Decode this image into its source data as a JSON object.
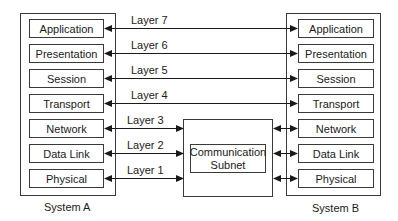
{
  "diagram": {
    "type": "OSI reference model communication diagram",
    "system_a": {
      "label": "System A",
      "layers": [
        "Application",
        "Presentation",
        "Session",
        "Transport",
        "Network",
        "Data Link",
        "Physical"
      ]
    },
    "system_b": {
      "label": "System B",
      "layers": [
        "Application",
        "Presentation",
        "Session",
        "Transport",
        "Network",
        "Data Link",
        "Physical"
      ]
    },
    "subnet": {
      "line1": "Communication",
      "line2": "Subnet"
    },
    "layer_labels": [
      "Layer 7",
      "Layer 6",
      "Layer 5",
      "Layer 4",
      "Layer 3",
      "Layer 2",
      "Layer 1"
    ],
    "colors": {
      "stroke": "#3a3a3a",
      "text": "#1a1a1a",
      "background": "#ffffff"
    }
  }
}
